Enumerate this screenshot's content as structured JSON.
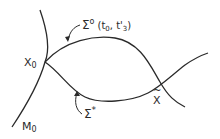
{
  "diagram": {
    "labels": {
      "sigma0_main": "Σ",
      "sigma0_sup": "o",
      "sigma0_args": "(t",
      "sigma0_sub0": "0",
      "sigma0_comma": ", t'",
      "sigma0_sub3": "3",
      "sigma0_close": ")",
      "x0_main": "X",
      "x0_sub": "0",
      "m0_main": "M",
      "m0_sub": "0",
      "sigma_star_main": "Σ",
      "sigma_star_sup": "*",
      "x_tilde_main": "X",
      "x_tilde_accent": "~"
    },
    "curves": [
      {
        "name": "manifold-M0"
      },
      {
        "name": "trajectory-sigma0"
      },
      {
        "name": "trajectory-sigma-star"
      }
    ],
    "colors": {
      "stroke": "#2a2a2a",
      "background": "#ffffff"
    }
  }
}
